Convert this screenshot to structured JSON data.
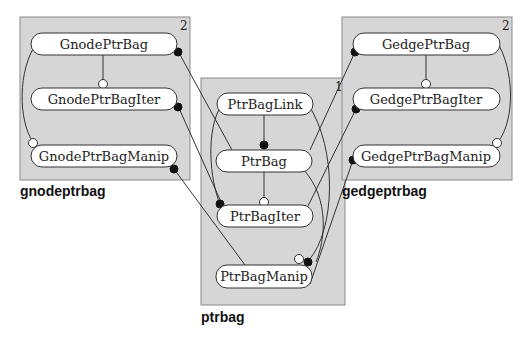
{
  "diagram": {
    "packages": [
      {
        "id": "gnodeptrbag",
        "label": "gnodeptrbag",
        "level": "2",
        "nodes": [
          "GnodePtrBag",
          "GnodePtrBagIter",
          "GnodePtrBagManip"
        ]
      },
      {
        "id": "ptrbag",
        "label": "ptrbag",
        "level": "1",
        "nodes": [
          "PtrBagLink",
          "PtrBag",
          "PtrBagIter",
          "PtrBagManip"
        ]
      },
      {
        "id": "gedgeptrbag",
        "label": "gedgeptrbag",
        "level": "2",
        "nodes": [
          "GedgePtrBag",
          "GedgePtrBagIter",
          "GedgePtrBagManip"
        ]
      }
    ],
    "edges": [
      {
        "from": "GnodePtrBag",
        "to": "GnodePtrBagIter",
        "end": "open"
      },
      {
        "from": "GnodePtrBag",
        "to": "GnodePtrBagManip",
        "end": "open"
      },
      {
        "from": "GnodePtrBag",
        "to": "PtrBag",
        "end": "filled"
      },
      {
        "from": "GnodePtrBagIter",
        "to": "PtrBagIter",
        "end": "filled"
      },
      {
        "from": "GnodePtrBagManip",
        "to": "PtrBagManip",
        "end": "filled"
      },
      {
        "from": "PtrBagLink",
        "to": "PtrBag",
        "end": "filled"
      },
      {
        "from": "PtrBag",
        "to": "PtrBagIter",
        "end": "open"
      },
      {
        "from": "PtrBagLink",
        "to": "PtrBagIter",
        "end": "filled"
      },
      {
        "from": "PtrBagLink",
        "to": "PtrBagManip",
        "end": "filled"
      },
      {
        "from": "PtrBag",
        "to": "PtrBagManip",
        "end": "open"
      },
      {
        "from": "GedgePtrBag",
        "to": "GedgePtrBagIter",
        "end": "open"
      },
      {
        "from": "GedgePtrBag",
        "to": "GedgePtrBagManip",
        "end": "open"
      },
      {
        "from": "PtrBag",
        "to": "GedgePtrBag",
        "end": "filled"
      },
      {
        "from": "PtrBagIter",
        "to": "GedgePtrBagIter",
        "end": "filled"
      },
      {
        "from": "PtrBagManip",
        "to": "GedgePtrBagManip",
        "end": "filled"
      }
    ]
  }
}
